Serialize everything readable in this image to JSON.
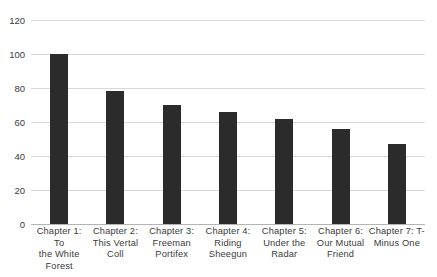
{
  "chart_data": {
    "type": "bar",
    "title": "",
    "subtitle": "",
    "xlabel": "",
    "ylabel": "",
    "ylim": [
      0,
      120
    ],
    "yticks": [
      0,
      20,
      40,
      60,
      80,
      100,
      120
    ],
    "grid": true,
    "legend": false,
    "legend_position": "none",
    "bar_color": "#2b2b2b",
    "grid_color": "#d9d9d9",
    "axis_color": "#b4b4b4",
    "text_color": "#3b3b3b",
    "categories": [
      "Chapter 1: To the White Forest",
      "Chapter 2: This Vertal Coll",
      "Chapter 3: Freeman Portifex",
      "Chapter 4: Riding Sheegun",
      "Chapter 5: Under the Radar",
      "Chapter 6: Our Mutual Friend",
      "Chapter 7: T-Minus One"
    ],
    "category_lines": [
      [
        "Chapter 1: To",
        "the White",
        "Forest"
      ],
      [
        "Chapter 2:",
        "This Vertal",
        "Coll"
      ],
      [
        "Chapter 3:",
        "Freeman",
        "Portifex"
      ],
      [
        "Chapter 4:",
        "Riding",
        "Sheegun"
      ],
      [
        "Chapter 5:",
        "Under the",
        "Radar"
      ],
      [
        "Chapter 6:",
        "Our Mutual",
        "Friend"
      ],
      [
        "Chapter 7: T-",
        "Minus One"
      ]
    ],
    "values": [
      100,
      78,
      70,
      66,
      62,
      56,
      47
    ]
  }
}
